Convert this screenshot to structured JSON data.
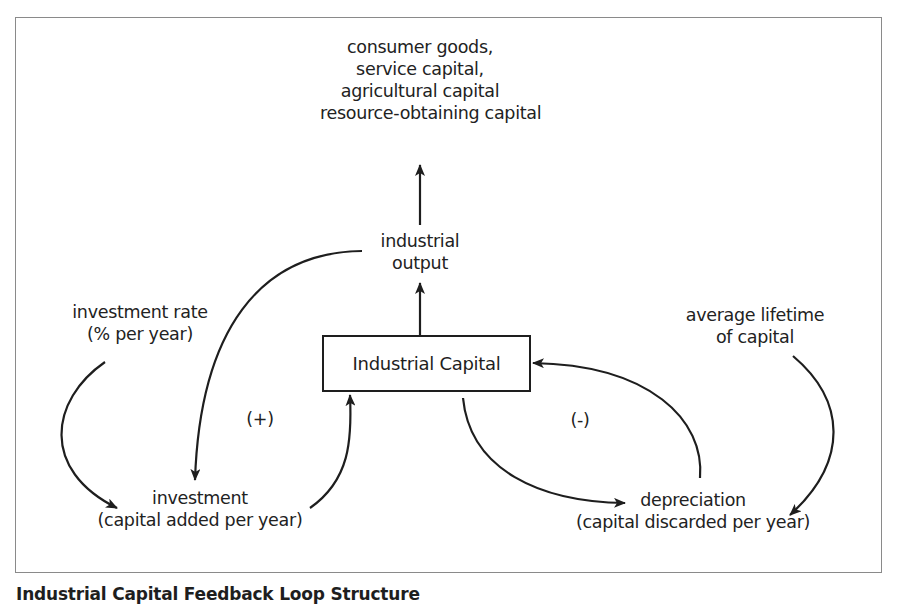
{
  "diagram": {
    "title": "Industrial Capital Feedback Loop",
    "caption": "Industrial Capital Feedback Loop Structure",
    "stock": {
      "label": "Industrial Capital"
    },
    "nodes": {
      "outputs": {
        "lines": [
          "consumer goods,",
          "service capital,",
          "agricultural capital",
          "resource-obtaining capital"
        ]
      },
      "industrial_output": {
        "lines": [
          "industrial",
          "output"
        ]
      },
      "investment_rate": {
        "lines": [
          "investment rate",
          "(% per year)"
        ]
      },
      "investment": {
        "lines": [
          "investment",
          "(capital added per year)"
        ]
      },
      "average_lifetime": {
        "lines": [
          "average lifetime",
          "of capital"
        ]
      },
      "depreciation": {
        "lines": [
          "depreciation",
          "(capital discarded per year)"
        ]
      }
    },
    "loop_polarity": {
      "reinforcing": "(+)",
      "balancing": "(-)"
    },
    "links": [
      {
        "from": "Industrial Capital",
        "to": "industrial output"
      },
      {
        "from": "industrial output",
        "to": "consumer goods, service capital, agricultural capital, resource-obtaining capital"
      },
      {
        "from": "industrial output",
        "to": "investment"
      },
      {
        "from": "investment rate",
        "to": "investment"
      },
      {
        "from": "investment",
        "to": "Industrial Capital"
      },
      {
        "from": "Industrial Capital",
        "to": "depreciation"
      },
      {
        "from": "average lifetime of capital",
        "to": "depreciation"
      },
      {
        "from": "depreciation",
        "to": "Industrial Capital"
      }
    ],
    "colors": {
      "ink": "#1e1e1e",
      "frame": "#8a8a8a",
      "background": "#ffffff"
    }
  }
}
